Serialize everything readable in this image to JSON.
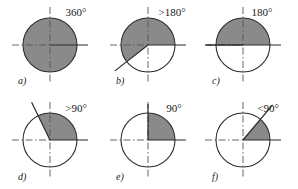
{
  "figure": {
    "width": 298,
    "height": 189,
    "background": "#ffffff",
    "shade_color": "#8a8a8a",
    "outline_color": "#2b2b2b",
    "axis_color": "#555555",
    "text_color": "#1a1a1a"
  },
  "panels": [
    {
      "id": "a",
      "label": "a)",
      "angle_label": "360°",
      "cx": 50,
      "cy": 45,
      "r": 27,
      "start_deg": 0,
      "end_deg": 360,
      "full_circle": true,
      "ray_deg": null,
      "ray_len": 0,
      "label_x": 18,
      "label_y": 84,
      "angle_label_x": 76,
      "angle_label_y": 16,
      "solid_axis": "horizontal-right"
    },
    {
      "id": "b",
      "label": "b)",
      "angle_label": ">180°",
      "cx": 148,
      "cy": 45,
      "r": 27,
      "start_deg": 0,
      "end_deg": 218,
      "full_circle": false,
      "ray_deg": 218,
      "ray_len": 42,
      "label_x": 116,
      "label_y": 84,
      "angle_label_x": 172,
      "angle_label_y": 16,
      "solid_axis": "horizontal-right"
    },
    {
      "id": "c",
      "label": "c)",
      "angle_label": "180°",
      "cx": 243,
      "cy": 45,
      "r": 27,
      "start_deg": 0,
      "end_deg": 180,
      "full_circle": false,
      "ray_deg": 180,
      "ray_len": 36,
      "label_x": 212,
      "label_y": 84,
      "angle_label_x": 262,
      "angle_label_y": 16,
      "solid_axis": "horizontal-both"
    },
    {
      "id": "d",
      "label": "d)",
      "angle_label": ">90°",
      "cx": 50,
      "cy": 140,
      "r": 27,
      "start_deg": 0,
      "end_deg": 116,
      "full_circle": false,
      "ray_deg": 116,
      "ray_len": 42,
      "label_x": 18,
      "label_y": 180,
      "angle_label_x": 76,
      "angle_label_y": 112,
      "solid_axis": "horizontal-right"
    },
    {
      "id": "e",
      "label": "e)",
      "angle_label": "90°",
      "cx": 148,
      "cy": 140,
      "r": 27,
      "start_deg": 0,
      "end_deg": 90,
      "full_circle": false,
      "ray_deg": 90,
      "ray_len": 36,
      "label_x": 116,
      "label_y": 180,
      "angle_label_x": 174,
      "angle_label_y": 112,
      "solid_axis": "horizontal-right"
    },
    {
      "id": "f",
      "label": "f)",
      "angle_label": "<90°",
      "cx": 243,
      "cy": 140,
      "r": 27,
      "start_deg": 0,
      "end_deg": 50,
      "full_circle": false,
      "ray_deg": 50,
      "ray_len": 46,
      "label_x": 212,
      "label_y": 180,
      "angle_label_x": 268,
      "angle_label_y": 112,
      "solid_axis": "horizontal-right"
    }
  ]
}
